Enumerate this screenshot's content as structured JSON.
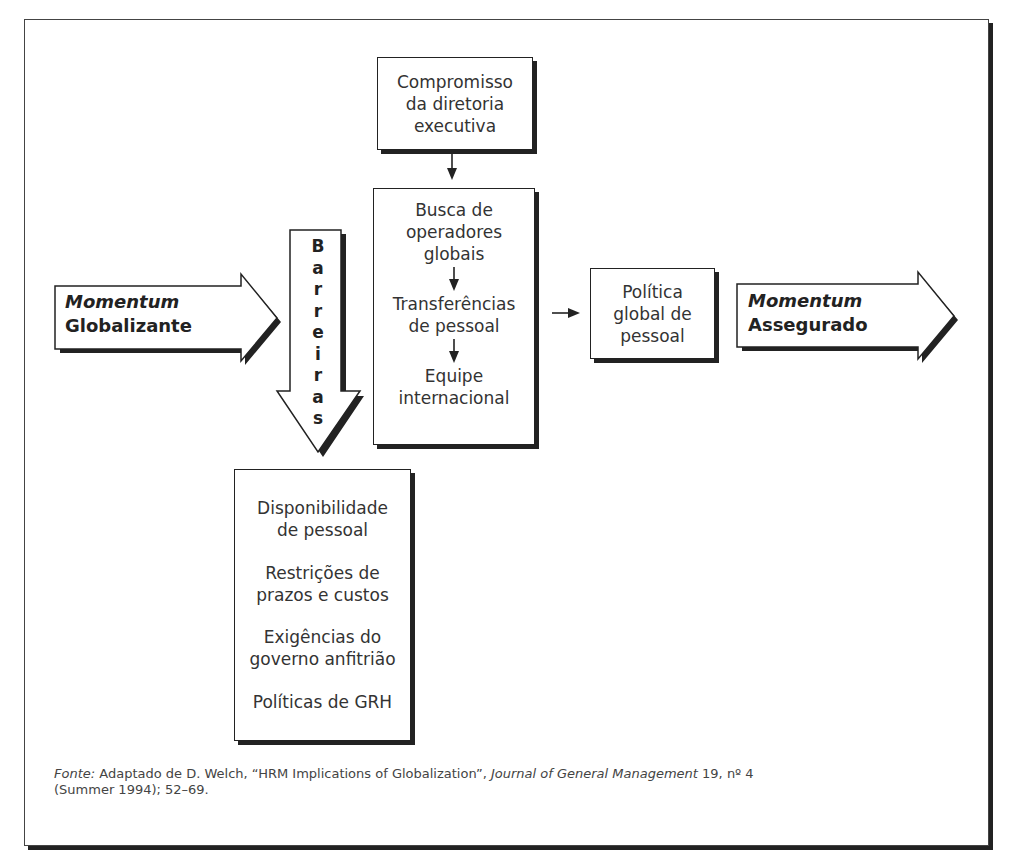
{
  "diagram": {
    "top_caption_clipped": "",
    "top_box": {
      "lines": [
        "Compromisso",
        "da diretoria",
        "executiva"
      ]
    },
    "middle_box": {
      "steps": [
        {
          "lines": [
            "Busca de",
            "operadores",
            "globais"
          ]
        },
        {
          "lines": [
            "Transferências",
            "de pessoal"
          ]
        },
        {
          "lines": [
            "Equipe",
            "internacional"
          ]
        }
      ],
      "step_arrow_glyph": "↓"
    },
    "left_arrow": {
      "label_italic": "Momentum",
      "label_bold": "Globalizante"
    },
    "barrier_arrow": {
      "letters": [
        "B",
        "a",
        "r",
        "r",
        "e",
        "i",
        "r",
        "a",
        "s"
      ],
      "word": "Barreiras"
    },
    "policy_box": {
      "lines": [
        "Política",
        "global de",
        "pessoal"
      ]
    },
    "right_arrow": {
      "label_italic": "Momentum",
      "label_bold": "Assegurado"
    },
    "barriers_box": {
      "items": [
        {
          "lines": [
            "Disponibilidade",
            "de pessoal"
          ]
        },
        {
          "lines": [
            "Restrições de",
            "prazos e custos"
          ]
        },
        {
          "lines": [
            "Exigências do",
            "governo anfitrião"
          ]
        },
        {
          "lines": [
            "Políticas de GRH"
          ]
        }
      ]
    },
    "connectors": {
      "top_to_middle": "↓",
      "middle_to_policy": "→"
    },
    "colors": {
      "stroke": "#222222",
      "shadow": "#222222",
      "text": "#333333",
      "background": "#ffffff"
    }
  },
  "source": {
    "label": "Fonte:",
    "text_before": " Adaptado de D. Welch, “HRM Implications of Globalization”, ",
    "journal": "Journal of General Management",
    "text_after": " 19, nº 4",
    "line2": "(Summer 1994); 52–69."
  }
}
